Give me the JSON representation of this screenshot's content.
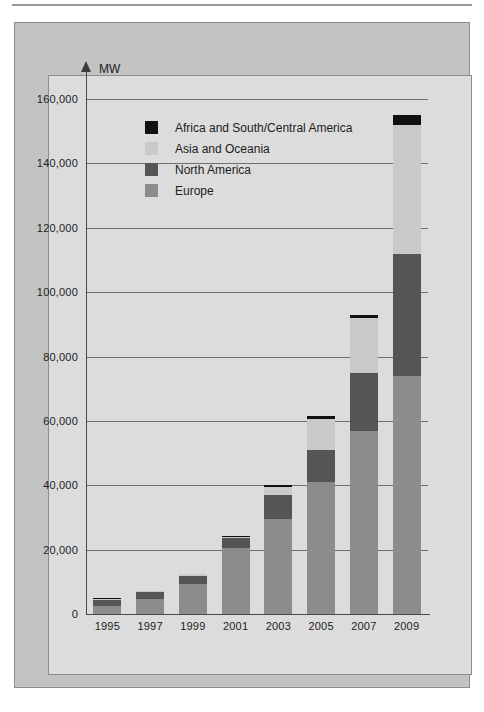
{
  "figure": {
    "unit_label": "MW"
  },
  "chart_data": {
    "type": "bar",
    "stacked": true,
    "title": "",
    "subtitle": "",
    "xlabel": "",
    "ylabel": "MW",
    "grid": true,
    "legend_position": "inside-top-left",
    "ylim": [
      0,
      160000
    ],
    "ytick_step": 20000,
    "ytick_labels": [
      "160,000",
      "140,000",
      "120,000",
      "100,000",
      "80,000",
      "60,000",
      "40,000",
      "20,000",
      "0"
    ],
    "ytick_values": [
      160000,
      140000,
      120000,
      100000,
      80000,
      60000,
      40000,
      20000,
      0
    ],
    "categories": [
      "1995",
      "1997",
      "1999",
      "2001",
      "2003",
      "2005",
      "2007",
      "2009"
    ],
    "series": [
      {
        "name": "Europe",
        "color": "#8c8c8c",
        "values": [
          2500,
          4700,
          9200,
          20500,
          29500,
          41000,
          57000,
          74000
        ]
      },
      {
        "name": "North America",
        "color": "#555555",
        "values": [
          2000,
          2000,
          2700,
          3000,
          7500,
          10000,
          18000,
          38000
        ]
      },
      {
        "name": "Asia and Oceania",
        "color": "#c9c9c9",
        "values": [
          300,
          300,
          400,
          400,
          2500,
          9500,
          17000,
          40000
        ]
      },
      {
        "name": "Africa and South/Central America",
        "color": "#111111",
        "values": [
          200,
          200,
          200,
          300,
          500,
          1000,
          1000,
          3000
        ]
      }
    ],
    "totals": [
      5000,
      7200,
      12500,
      24200,
      40000,
      61500,
      93000,
      155000
    ],
    "legend": [
      {
        "label": "Africa and South/Central America",
        "color": "#111111"
      },
      {
        "label": "Asia and Oceania",
        "color": "#c9c9c9"
      },
      {
        "label": "North America",
        "color": "#555555"
      },
      {
        "label": "Europe",
        "color": "#8c8c8c"
      }
    ]
  }
}
